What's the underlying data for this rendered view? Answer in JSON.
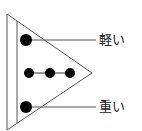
{
  "diagram": {
    "labels": {
      "top": "軽い",
      "bottom": "重い"
    },
    "colors": {
      "line": "#555555",
      "dot": "#000000",
      "text": "#222222"
    },
    "dots": {
      "top_count": 1,
      "middle_count": 3,
      "bottom_count": 1
    }
  }
}
